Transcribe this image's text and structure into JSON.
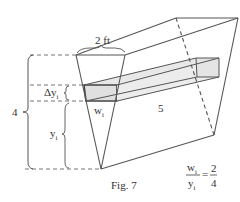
{
  "figure": {
    "caption": "Fig. 7",
    "labels": {
      "top_width": "2 ft",
      "height": "4",
      "delta_y": "Δy",
      "delta_y_sub": "i",
      "y": "y",
      "y_sub": "i",
      "w": "w",
      "w_sub": "i",
      "length": "5"
    },
    "equation": {
      "lhs_num": "w",
      "lhs_num_sub": "i",
      "lhs_den": "y",
      "lhs_den_sub": "i",
      "equals": "=",
      "rhs_num": "2",
      "rhs_den": "4"
    },
    "colors": {
      "line": "#555555",
      "slab_fill": "#e6e6e6",
      "slab_edge": "#444444",
      "text": "#333333"
    }
  }
}
